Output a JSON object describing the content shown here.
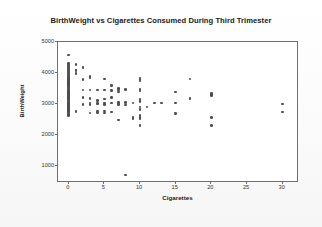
{
  "chart_data": {
    "type": "scatter",
    "title": "BirthWeight vs Cigarettes Consumed During Third Trimester",
    "xlabel": "Cigarettes",
    "ylabel": "BirthWeight",
    "xlim": [
      -1.5,
      32
    ],
    "ylim": [
      500,
      5000
    ],
    "xticks": [
      0,
      5,
      10,
      15,
      20,
      25,
      30
    ],
    "yticks": [
      1000,
      2000,
      3000,
      4000,
      5000
    ],
    "grid": false,
    "legend": null,
    "marker_color": "#4d4d4d",
    "frame_color": "#6f6f6f",
    "background": "#ffffff",
    "points": [
      [
        0,
        4580
      ],
      [
        0,
        4300
      ],
      [
        0,
        4240
      ],
      [
        0,
        4180
      ],
      [
        0,
        4120
      ],
      [
        0,
        4090
      ],
      [
        0,
        4060
      ],
      [
        0,
        4030
      ],
      [
        0,
        4000
      ],
      [
        0,
        3960
      ],
      [
        0,
        3930
      ],
      [
        0,
        3900
      ],
      [
        0,
        3870
      ],
      [
        0,
        3840
      ],
      [
        0,
        3810
      ],
      [
        0,
        3780
      ],
      [
        0,
        3750
      ],
      [
        0,
        3720
      ],
      [
        0,
        3690
      ],
      [
        0,
        3660
      ],
      [
        0,
        3630
      ],
      [
        0,
        3600
      ],
      [
        0,
        3570
      ],
      [
        0,
        3540
      ],
      [
        0,
        3510
      ],
      [
        0,
        3480
      ],
      [
        0,
        3450
      ],
      [
        0,
        3420
      ],
      [
        0,
        3390
      ],
      [
        0,
        3360
      ],
      [
        0,
        3330
      ],
      [
        0,
        3300
      ],
      [
        0,
        3270
      ],
      [
        0,
        3240
      ],
      [
        0,
        3210
      ],
      [
        0,
        3180
      ],
      [
        0,
        3150
      ],
      [
        0,
        3120
      ],
      [
        0,
        3090
      ],
      [
        0,
        3060
      ],
      [
        0,
        3030
      ],
      [
        0,
        3000
      ],
      [
        0,
        2970
      ],
      [
        0,
        2940
      ],
      [
        0,
        2910
      ],
      [
        0,
        2880
      ],
      [
        0,
        2850
      ],
      [
        0,
        2820
      ],
      [
        0,
        2790
      ],
      [
        0,
        2760
      ],
      [
        0,
        2730
      ],
      [
        0,
        2700
      ],
      [
        0,
        2660
      ],
      [
        0,
        2620
      ],
      [
        1,
        4270
      ],
      [
        1,
        4100
      ],
      [
        1,
        4070
      ],
      [
        1,
        3980
      ],
      [
        1,
        2750
      ],
      [
        2,
        4180
      ],
      [
        2,
        3780
      ],
      [
        2,
        3440
      ],
      [
        2,
        3200
      ],
      [
        2,
        2980
      ],
      [
        3,
        3900
      ],
      [
        3,
        3850
      ],
      [
        3,
        3440
      ],
      [
        3,
        3180
      ],
      [
        3,
        3020
      ],
      [
        3,
        2980
      ],
      [
        3,
        2700
      ],
      [
        4,
        3440
      ],
      [
        4,
        3100
      ],
      [
        4,
        3020
      ],
      [
        4,
        2990
      ],
      [
        4,
        2760
      ],
      [
        4,
        2720
      ],
      [
        5,
        3800
      ],
      [
        5,
        3440
      ],
      [
        5,
        3160
      ],
      [
        5,
        3020
      ],
      [
        5,
        2980
      ],
      [
        5,
        2760
      ],
      [
        5,
        2700
      ],
      [
        6,
        3600
      ],
      [
        6,
        3430
      ],
      [
        6,
        3200
      ],
      [
        6,
        3020
      ],
      [
        6,
        2740
      ],
      [
        7,
        3500
      ],
      [
        7,
        3440
      ],
      [
        7,
        3380
      ],
      [
        7,
        3040
      ],
      [
        7,
        2980
      ],
      [
        7,
        2480
      ],
      [
        8,
        3460
      ],
      [
        8,
        3040
      ],
      [
        8,
        2960
      ],
      [
        8,
        700
      ],
      [
        9,
        3020
      ],
      [
        9,
        2560
      ],
      [
        9,
        2520
      ],
      [
        10,
        3840
      ],
      [
        10,
        3800
      ],
      [
        10,
        3770
      ],
      [
        10,
        3740
      ],
      [
        10,
        3480
      ],
      [
        10,
        3450
      ],
      [
        10,
        3420
      ],
      [
        10,
        3160
      ],
      [
        10,
        3120
      ],
      [
        10,
        3080
      ],
      [
        10,
        2900
      ],
      [
        10,
        2820
      ],
      [
        10,
        2620
      ],
      [
        10,
        2560
      ],
      [
        10,
        2520
      ],
      [
        10,
        2300
      ],
      [
        11,
        2900
      ],
      [
        12,
        3030
      ],
      [
        13,
        3030
      ],
      [
        15,
        3380
      ],
      [
        15,
        3020
      ],
      [
        15,
        2680
      ],
      [
        17,
        3800
      ],
      [
        17,
        3180
      ],
      [
        20,
        3340
      ],
      [
        20,
        3300
      ],
      [
        20,
        3260
      ],
      [
        20,
        2560
      ],
      [
        20,
        2300
      ],
      [
        30,
        2990
      ],
      [
        30,
        2740
      ]
    ]
  }
}
